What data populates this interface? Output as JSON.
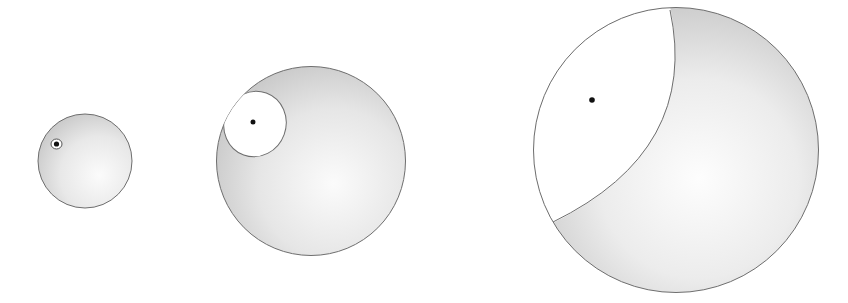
{
  "figure": {
    "colors": {
      "background": "#ffffff",
      "outline": "#6e6e6e",
      "shade_dark": "#c4c4c4",
      "shade_light": "#f6f6f6",
      "cap": "#ffffff",
      "dot": "#111111"
    },
    "spheres": [
      {
        "id": "small",
        "cx": 85,
        "cy": 161,
        "r": 47,
        "dot": {
          "x": 56,
          "y": 144,
          "r": 2.5
        }
      },
      {
        "id": "medium",
        "cx": 311,
        "cy": 161,
        "r": 95,
        "dot": {
          "x": 253,
          "y": 122,
          "r": 2.5
        }
      },
      {
        "id": "large",
        "cx": 676,
        "cy": 150,
        "r": 143,
        "dot": {
          "x": 592,
          "y": 100,
          "r": 2.8
        }
      }
    ]
  }
}
